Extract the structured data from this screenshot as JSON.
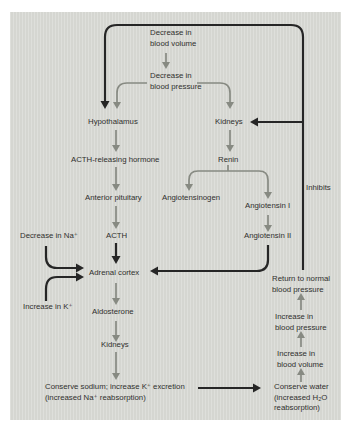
{
  "colors": {
    "panel_bg": "#d9dad5",
    "arrow_gray": "#878a82",
    "arrow_dark": "#262626",
    "text_color": "#30302e"
  },
  "nodes": {
    "decrease_blood_volume": "Decrease in\nblood volume",
    "decrease_blood_pressure": "Decrease in\nblood pressure",
    "hypothalamus": "Hypothalamus",
    "kidneys_upper": "Kidneys",
    "acth_releasing_hormone": "ACTH-releasing hormone",
    "renin": "Renin",
    "anterior_pituitary": "Anterior pituitary",
    "angiotensinogen": "Angiotensinogen",
    "angiotensin_i": "Angiotensin I",
    "inhibits": "Inhibits",
    "decrease_na": "Decrease in Na⁺",
    "acth": "ACTH",
    "angiotensin_ii": "Angiotensin II",
    "adrenal_cortex": "Adrenal cortex",
    "return_to_normal": "Return to normal\nblood pressure",
    "increase_k": "Increase in K⁺",
    "aldosterone": "Aldosterone",
    "increase_blood_pressure": "Increase in\nblood pressure",
    "kidneys_lower": "Kidneys",
    "increase_blood_volume": "Increase in\nblood volume",
    "conserve_sodium": "Conserve sodium; increase K⁺ excretion\n(increased Na⁺ reabsorption)",
    "conserve_water": "Conserve water\n(increased H₂O\nreabsorption)"
  },
  "edges": [
    {
      "from": "decrease_blood_volume",
      "to": "decrease_blood_pressure",
      "style": "gray"
    },
    {
      "from": "decrease_blood_pressure",
      "to": "hypothalamus",
      "style": "gray"
    },
    {
      "from": "decrease_blood_pressure",
      "to": "kidneys_upper",
      "style": "gray"
    },
    {
      "from": "hypothalamus",
      "to": "acth_releasing_hormone",
      "style": "gray"
    },
    {
      "from": "kidneys_upper",
      "to": "renin",
      "style": "gray"
    },
    {
      "from": "acth_releasing_hormone",
      "to": "anterior_pituitary",
      "style": "gray"
    },
    {
      "from": "anterior_pituitary",
      "to": "acth",
      "style": "gray"
    },
    {
      "from": "renin",
      "to": "angiotensinogen",
      "style": "gray"
    },
    {
      "from": "renin",
      "to": "angiotensin_i",
      "style": "gray"
    },
    {
      "from": "angiotensin_i",
      "to": "angiotensin_ii",
      "style": "gray"
    },
    {
      "from": "acth",
      "to": "adrenal_cortex",
      "style": "dark"
    },
    {
      "from": "decrease_na",
      "to": "adrenal_cortex",
      "style": "dark"
    },
    {
      "from": "increase_k",
      "to": "adrenal_cortex",
      "style": "dark"
    },
    {
      "from": "angiotensin_ii",
      "to": "adrenal_cortex",
      "style": "dark"
    },
    {
      "from": "adrenal_cortex",
      "to": "aldosterone",
      "style": "gray"
    },
    {
      "from": "aldosterone",
      "to": "kidneys_lower",
      "style": "gray"
    },
    {
      "from": "kidneys_lower",
      "to": "conserve_sodium",
      "style": "gray"
    },
    {
      "from": "conserve_sodium",
      "to": "conserve_water",
      "style": "dark"
    },
    {
      "from": "conserve_water",
      "to": "increase_blood_volume",
      "style": "gray"
    },
    {
      "from": "increase_blood_volume",
      "to": "increase_blood_pressure",
      "style": "gray"
    },
    {
      "from": "increase_blood_pressure",
      "to": "return_to_normal",
      "style": "gray"
    },
    {
      "from": "return_to_normal",
      "to": "hypothalamus",
      "style": "dark",
      "label": "Inhibits"
    },
    {
      "from": "return_to_normal",
      "to": "kidneys_upper",
      "style": "dark",
      "label": "Inhibits"
    }
  ]
}
